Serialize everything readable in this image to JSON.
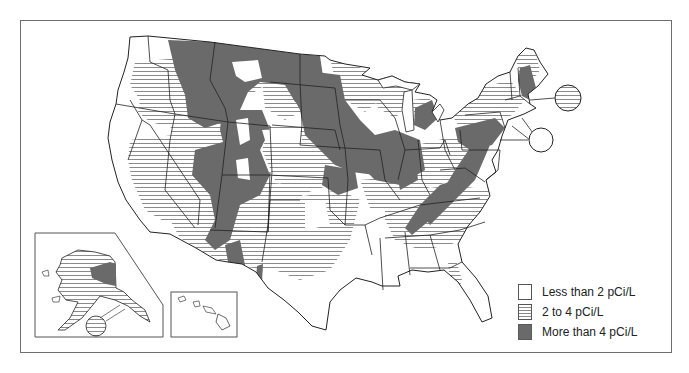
{
  "map": {
    "title": "",
    "subject": "Radon zones of the United States",
    "insets": [
      "Alaska",
      "Hawaii"
    ],
    "callouts": [
      {
        "region": "Massachusetts islands",
        "level": "2 to 4 pCi/L"
      },
      {
        "region": "Rhode Island / Connecticut coast",
        "level": "Less than 2 pCi/L"
      }
    ]
  },
  "legend": {
    "items": [
      {
        "key": "low",
        "label": "Less than 2 pCi/L",
        "color": "#ffffff",
        "pattern": "blank"
      },
      {
        "key": "mid",
        "label": "2 to 4 pCi/L",
        "color": "#8a8a8a",
        "pattern": "horizontal-stripes"
      },
      {
        "key": "high",
        "label": "More than 4 pCi/L",
        "color": "#6a6a6a",
        "pattern": "solid"
      }
    ]
  },
  "colors": {
    "frame": "#6e6e6e",
    "state_border": "#222222",
    "stripe": "#8a8a8a",
    "high_fill": "#6a6a6a",
    "background": "#ffffff"
  }
}
